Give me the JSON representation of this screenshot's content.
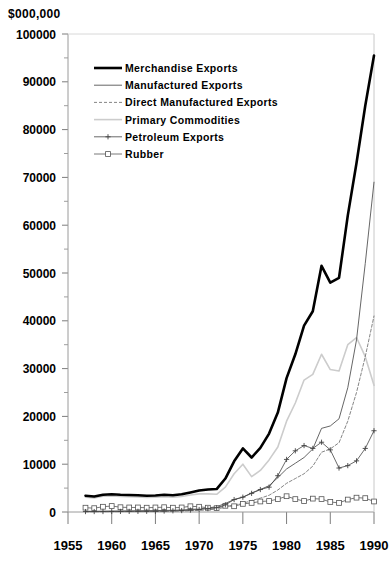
{
  "chart_data": {
    "type": "line",
    "title": "",
    "ylabel": "$000,000",
    "xlabel": "",
    "xlim": [
      1955,
      1990
    ],
    "ylim": [
      0,
      100000
    ],
    "grid": false,
    "legend_position": "top-left",
    "ytick_labels": [
      "0",
      "10000",
      "20000",
      "30000",
      "40000",
      "50000",
      "60000",
      "70000",
      "80000",
      "90000",
      "100000"
    ],
    "ytick_values": [
      0,
      10000,
      20000,
      30000,
      40000,
      50000,
      60000,
      70000,
      80000,
      90000,
      100000
    ],
    "yminor_step": 5000,
    "xtick_labels": [
      "1955",
      "1960",
      "1965",
      "1970",
      "1975",
      "1980",
      "1985",
      "1990"
    ],
    "xtick_values": [
      1955,
      1960,
      1965,
      1970,
      1975,
      1980,
      1985,
      1990
    ],
    "x": [
      1957,
      1958,
      1959,
      1960,
      1961,
      1962,
      1963,
      1964,
      1965,
      1966,
      1967,
      1968,
      1969,
      1970,
      1971,
      1972,
      1973,
      1974,
      1975,
      1976,
      1977,
      1978,
      1979,
      1980,
      1981,
      1982,
      1983,
      1984,
      1985,
      1986,
      1987,
      1988,
      1989,
      1990
    ],
    "series": [
      {
        "name": "Merchandise Exports",
        "style": "solid-thick",
        "color": "#000000",
        "marker": "none",
        "values": [
          3400,
          3250,
          3600,
          3700,
          3600,
          3550,
          3500,
          3400,
          3450,
          3600,
          3500,
          3700,
          4100,
          4500,
          4700,
          4800,
          7000,
          10600,
          13300,
          11400,
          13400,
          16400,
          20800,
          28000,
          33000,
          39000,
          42000,
          51500,
          48000,
          49000,
          62000,
          73000,
          85000,
          95500
        ]
      },
      {
        "name": "Manufactured Exports",
        "style": "solid-thin",
        "color": "#555555",
        "marker": "none",
        "values": [
          150,
          150,
          180,
          200,
          220,
          240,
          260,
          280,
          300,
          330,
          360,
          420,
          520,
          650,
          850,
          1100,
          1800,
          2600,
          3100,
          4000,
          4700,
          5500,
          7200,
          9000,
          10200,
          11400,
          13200,
          17500,
          18000,
          19500,
          26000,
          36000,
          52000,
          69000
        ]
      },
      {
        "name": "Direct Manufactured Exports",
        "style": "dotted",
        "color": "#777777",
        "marker": "none",
        "values": [
          60,
          60,
          70,
          80,
          90,
          100,
          110,
          120,
          130,
          150,
          170,
          200,
          260,
          330,
          450,
          620,
          1000,
          1500,
          1800,
          2400,
          2900,
          3500,
          4600,
          6000,
          7000,
          8000,
          9600,
          12500,
          13200,
          14500,
          19000,
          25000,
          32500,
          41000
        ]
      },
      {
        "name": "Primary Commodities",
        "style": "solid-light",
        "color": "#cccccc",
        "marker": "none",
        "values": [
          3100,
          2950,
          3300,
          3350,
          3250,
          3200,
          3150,
          3050,
          3100,
          3200,
          3100,
          3250,
          3550,
          3800,
          3800,
          3700,
          5200,
          8000,
          10000,
          7400,
          8700,
          10900,
          13600,
          19000,
          22800,
          27600,
          28800,
          33000,
          29800,
          29500,
          35000,
          36500,
          32500,
          26500
        ]
      },
      {
        "name": "Petroleum Exports",
        "style": "solid-plus",
        "color": "#444444",
        "marker": "plus",
        "values": [
          90,
          95,
          100,
          110,
          120,
          130,
          140,
          150,
          160,
          200,
          250,
          300,
          400,
          520,
          700,
          900,
          1500,
          2600,
          3100,
          3900,
          4700,
          5200,
          7600,
          11000,
          12800,
          13900,
          13300,
          14600,
          13000,
          9200,
          9700,
          10700,
          13300,
          17000
        ]
      },
      {
        "name": "Rubber",
        "style": "solid-square",
        "color": "#555555",
        "marker": "square",
        "values": [
          900,
          800,
          1100,
          1250,
          1000,
          950,
          950,
          900,
          950,
          1000,
          900,
          950,
          1200,
          1100,
          900,
          800,
          1300,
          1200,
          1700,
          1900,
          2200,
          2300,
          2700,
          3300,
          2700,
          2300,
          2800,
          2700,
          2100,
          1900,
          2600,
          3000,
          2900,
          2200
        ]
      }
    ]
  },
  "legend": {
    "items": [
      {
        "label": "Merchandise Exports"
      },
      {
        "label": "Manufactured Exports"
      },
      {
        "label": "Direct Manufactured Exports"
      },
      {
        "label": "Primary Commodities"
      },
      {
        "label": "Petroleum Exports"
      },
      {
        "label": "Rubber"
      }
    ]
  }
}
